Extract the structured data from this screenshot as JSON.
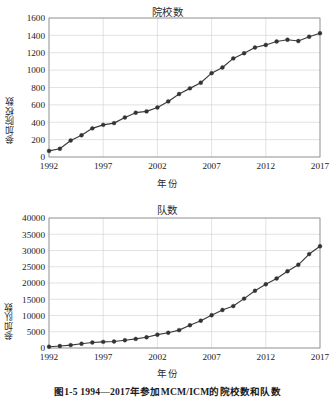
{
  "figure": {
    "caption": "图1-5  1994—2017年参加MCM/ICM的院校数和队数",
    "background": "#ffffff",
    "line_color": "#3a3a3a",
    "marker_color": "#333333",
    "grid_color": "#cfcfcf",
    "axis_color": "#8a8a8a"
  },
  "chart_data": [
    {
      "type": "line",
      "id": "institutions",
      "title": "院校数",
      "xlabel": "年份",
      "ylabel": "参加院校数",
      "grid": true,
      "legend": "none",
      "xlim": [
        1992,
        2017
      ],
      "ylim": [
        0,
        1600
      ],
      "xticks": [
        "1992",
        "1997",
        "2002",
        "2007",
        "2012",
        "2017"
      ],
      "xtick_values": [
        1992,
        1997,
        2002,
        2007,
        2012,
        2017
      ],
      "yticks": [
        "0",
        "200",
        "400",
        "600",
        "800",
        "1000",
        "1200",
        "1400",
        "1600"
      ],
      "ytick_values": [
        0,
        200,
        400,
        600,
        800,
        1000,
        1200,
        1400,
        1600
      ],
      "x": [
        1992,
        1993,
        1994,
        1995,
        1996,
        1997,
        1998,
        1999,
        2000,
        2001,
        2002,
        2003,
        2004,
        2005,
        2006,
        2007,
        2008,
        2009,
        2010,
        2011,
        2012,
        2013,
        2014,
        2015,
        2016,
        2017
      ],
      "values": [
        70,
        95,
        190,
        250,
        330,
        370,
        390,
        455,
        510,
        525,
        570,
        640,
        725,
        790,
        855,
        965,
        1030,
        1135,
        1195,
        1260,
        1290,
        1330,
        1350,
        1335,
        1385,
        1425
      ]
    },
    {
      "type": "line",
      "id": "teams",
      "title": "队数",
      "xlabel": "年份",
      "ylabel": "参加队数",
      "grid": true,
      "legend": "none",
      "xlim": [
        1992,
        2017
      ],
      "ylim": [
        0,
        40000
      ],
      "xticks": [
        "1992",
        "1997",
        "2002",
        "2007",
        "2012",
        "2017"
      ],
      "xtick_values": [
        1992,
        1997,
        2002,
        2007,
        2012,
        2017
      ],
      "yticks": [
        "0",
        "5000",
        "10000",
        "15000",
        "20000",
        "25000",
        "30000",
        "35000",
        "40000"
      ],
      "ytick_values": [
        0,
        5000,
        10000,
        15000,
        20000,
        25000,
        30000,
        35000,
        40000
      ],
      "x": [
        1992,
        1993,
        1994,
        1995,
        1996,
        1997,
        1998,
        1999,
        2000,
        2001,
        2002,
        2003,
        2004,
        2005,
        2006,
        2007,
        2008,
        2009,
        2010,
        2011,
        2012,
        2013,
        2014,
        2015,
        2016,
        2017
      ],
      "values": [
        400,
        600,
        900,
        1300,
        1700,
        1900,
        2000,
        2400,
        2800,
        3300,
        4100,
        4700,
        5500,
        7000,
        8400,
        10100,
        11700,
        12900,
        15200,
        17600,
        19600,
        21400,
        23600,
        25600,
        28900,
        31300
      ]
    }
  ]
}
